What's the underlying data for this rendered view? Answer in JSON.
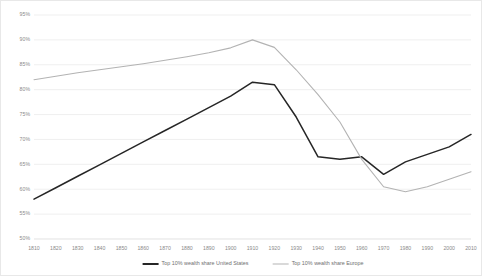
{
  "chart_data": {
    "type": "line",
    "title": "",
    "subtitle": "",
    "xlabel": "",
    "ylabel": "",
    "grid": true,
    "legend_position": "bottom",
    "xlim": [
      1810,
      2010
    ],
    "ylim": [
      50,
      95
    ],
    "ytick_labels": [
      "95%",
      "90%",
      "85%",
      "80%",
      "75%",
      "70%",
      "65%",
      "60%",
      "55%",
      "50%"
    ],
    "ytick_values": [
      95,
      90,
      85,
      80,
      75,
      70,
      65,
      60,
      55,
      50
    ],
    "xtick_labels": [
      "1810",
      "1820",
      "1830",
      "1840",
      "1850",
      "1860",
      "1870",
      "1880",
      "1890",
      "1900",
      "1910",
      "1920",
      "1930",
      "1940",
      "1950",
      "1960",
      "1970",
      "1980",
      "1990",
      "2000",
      "2010"
    ],
    "x": [
      1810,
      1820,
      1830,
      1840,
      1850,
      1860,
      1870,
      1880,
      1890,
      1900,
      1910,
      1920,
      1930,
      1940,
      1950,
      1960,
      1970,
      1980,
      1990,
      2000,
      2010
    ],
    "series": [
      {
        "name": "Top 10% wealth share United States",
        "color": "#262626",
        "width": 1.5,
        "values": [
          58.0,
          60.3,
          62.6,
          64.9,
          67.2,
          69.5,
          71.8,
          74.1,
          76.4,
          78.7,
          81.5,
          81.0,
          74.5,
          66.5,
          66.0,
          66.5,
          63.0,
          65.5,
          67.0,
          68.5,
          71.0
        ]
      },
      {
        "name": "Top 10% wealth share Europe",
        "color": "#b3b3b3",
        "width": 1.1,
        "values": [
          82.0,
          82.7,
          83.4,
          84.0,
          84.6,
          85.2,
          85.9,
          86.6,
          87.4,
          88.4,
          90.0,
          88.5,
          84.0,
          79.0,
          73.5,
          66.0,
          60.5,
          59.5,
          60.5,
          62.0,
          63.5
        ]
      }
    ]
  },
  "legend": {
    "items": [
      {
        "label": "Top 10% wealth share United States",
        "color": "#262626"
      },
      {
        "label": "Top 10% wealth share Europe",
        "color": "#b3b3b3"
      }
    ]
  }
}
